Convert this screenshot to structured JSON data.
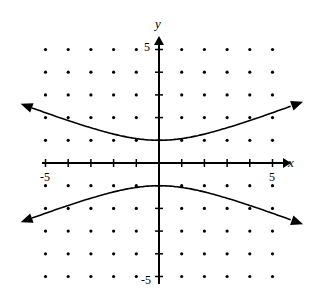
{
  "chart_data": {
    "type": "line",
    "title": "",
    "xlabel": "x",
    "ylabel": "y",
    "xlim": [
      -5,
      5
    ],
    "ylim": [
      -5,
      5
    ],
    "grid": "dots",
    "tick_labels": {
      "x_min": "-5",
      "x_max": "5",
      "y_max": "5",
      "y_min": "-5"
    },
    "series": [
      {
        "name": "upper branch",
        "points": [
          [
            -5.8,
            2.5
          ],
          [
            -4,
            1.9
          ],
          [
            -2,
            1.3
          ],
          [
            0,
            1
          ],
          [
            2,
            1.3
          ],
          [
            4,
            1.9
          ],
          [
            6,
            2.6
          ]
        ]
      },
      {
        "name": "lower branch",
        "points": [
          [
            -5.8,
            -2.5
          ],
          [
            -4,
            -1.9
          ],
          [
            -2,
            -1.3
          ],
          [
            0,
            -1
          ],
          [
            2,
            -1.3
          ],
          [
            4,
            -1.9
          ],
          [
            6,
            -2.6
          ]
        ]
      }
    ]
  }
}
